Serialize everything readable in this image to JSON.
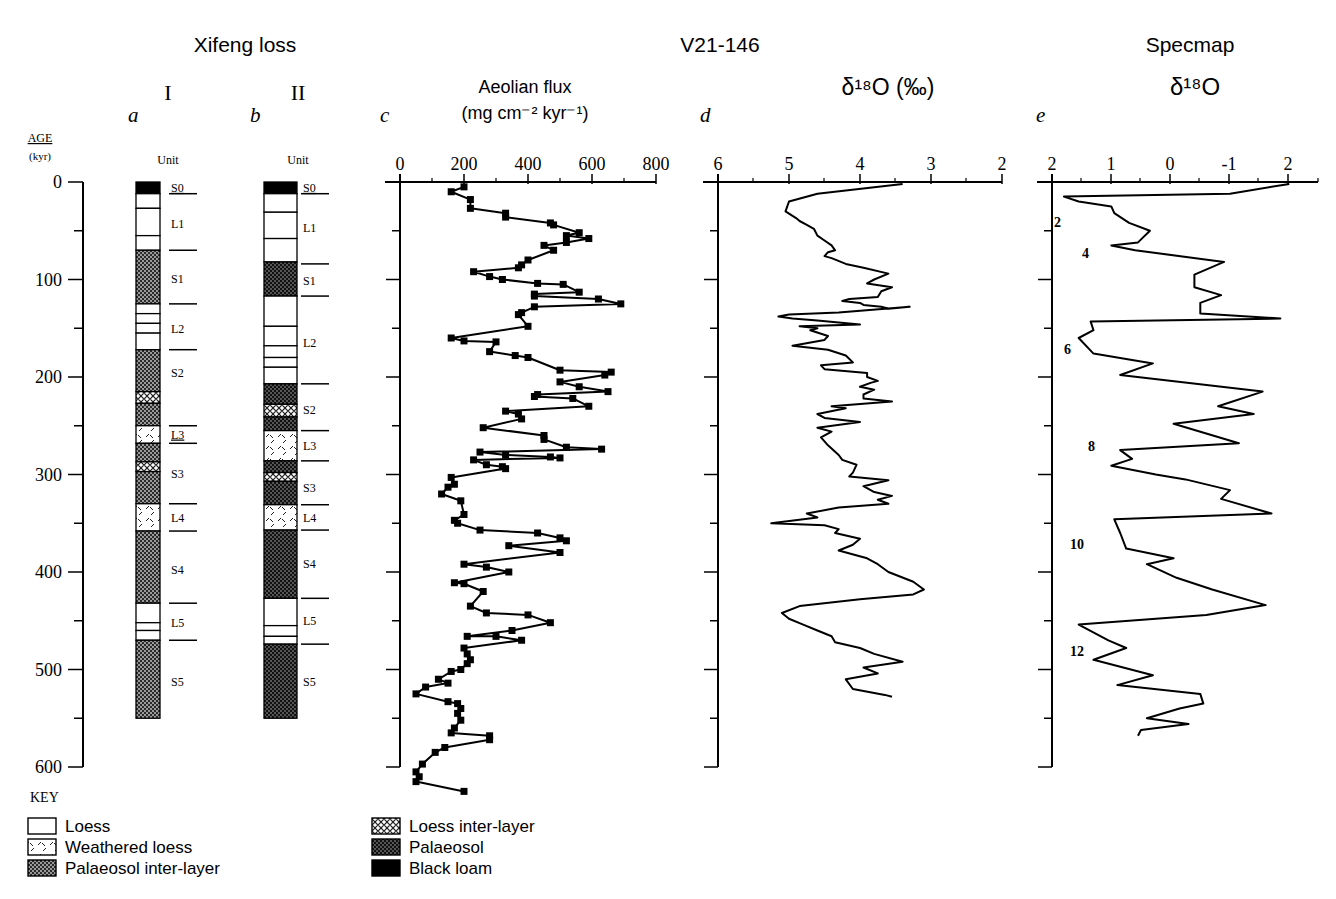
{
  "headers": {
    "xifeng": "Xifeng loss",
    "v21": "V21-146",
    "specmap": "Specmap",
    "col_a_roman": "I",
    "col_b_roman": "II",
    "panels": [
      "a",
      "b",
      "c",
      "d",
      "e"
    ],
    "aeolian_title": "Aeolian flux",
    "aeolian_units": "(mg cm⁻² kyr⁻¹)",
    "d18o_d": "δ¹⁸O (‰)",
    "d18o_e": "δ¹⁸O",
    "unit_label": "Unit"
  },
  "age_axis": {
    "label": "AGE",
    "units": "(kyr)",
    "ticks": [
      0,
      100,
      200,
      300,
      400,
      500,
      600
    ]
  },
  "key": {
    "title": "KEY",
    "items": [
      {
        "label": "Loess",
        "pattern": "loess"
      },
      {
        "label": "Weathered loess",
        "pattern": "weathered"
      },
      {
        "label": "Palaeosol inter-layer",
        "pattern": "palaeo-inter"
      },
      {
        "label": "Loess inter-layer",
        "pattern": "loess-inter"
      },
      {
        "label": "Palaeosol",
        "pattern": "palaeosol"
      },
      {
        "label": "Black loam",
        "pattern": "black"
      }
    ]
  },
  "stratigraphy": {
    "column_a": {
      "layers": [
        {
          "from": 0,
          "to": 12,
          "type": "black"
        },
        {
          "from": 12,
          "to": 27,
          "type": "loess"
        },
        {
          "from": 27,
          "to": 55,
          "type": "loess"
        },
        {
          "from": 55,
          "to": 70,
          "type": "loess"
        },
        {
          "from": 70,
          "to": 125,
          "type": "palaeo-inter"
        },
        {
          "from": 125,
          "to": 135,
          "type": "loess"
        },
        {
          "from": 135,
          "to": 145,
          "type": "loess"
        },
        {
          "from": 145,
          "to": 155,
          "type": "loess"
        },
        {
          "from": 155,
          "to": 172,
          "type": "loess"
        },
        {
          "from": 172,
          "to": 215,
          "type": "palaeo-inter"
        },
        {
          "from": 215,
          "to": 227,
          "type": "loess-inter"
        },
        {
          "from": 227,
          "to": 250,
          "type": "palaeo-inter"
        },
        {
          "from": 250,
          "to": 268,
          "type": "weathered"
        },
        {
          "from": 268,
          "to": 287,
          "type": "palaeo-inter"
        },
        {
          "from": 287,
          "to": 297,
          "type": "loess-inter"
        },
        {
          "from": 297,
          "to": 330,
          "type": "palaeo-inter"
        },
        {
          "from": 330,
          "to": 358,
          "type": "weathered"
        },
        {
          "from": 358,
          "to": 432,
          "type": "palaeo-inter"
        },
        {
          "from": 432,
          "to": 452,
          "type": "loess"
        },
        {
          "from": 452,
          "to": 460,
          "type": "loess"
        },
        {
          "from": 460,
          "to": 470,
          "type": "loess"
        },
        {
          "from": 470,
          "to": 550,
          "type": "palaeo-inter"
        }
      ],
      "units": [
        {
          "label": "S0",
          "at": 5,
          "underline": true
        },
        {
          "label": "L1",
          "at": 42
        },
        {
          "label": "S1",
          "at": 98
        },
        {
          "label": "L2",
          "at": 150
        },
        {
          "label": "S2",
          "at": 195
        },
        {
          "label": "L3",
          "at": 258,
          "underline": true
        },
        {
          "label": "S3",
          "at": 298
        },
        {
          "label": "L4",
          "at": 344
        },
        {
          "label": "S4",
          "at": 397
        },
        {
          "label": "L5",
          "at": 451
        },
        {
          "label": "S5",
          "at": 512
        }
      ],
      "boundaries": [
        12,
        70,
        125,
        172,
        250,
        268,
        330,
        358,
        432,
        470
      ]
    },
    "column_b": {
      "layers": [
        {
          "from": 0,
          "to": 12,
          "type": "black"
        },
        {
          "from": 12,
          "to": 31,
          "type": "loess"
        },
        {
          "from": 31,
          "to": 58,
          "type": "loess"
        },
        {
          "from": 58,
          "to": 82,
          "type": "loess"
        },
        {
          "from": 82,
          "to": 117,
          "type": "palaeosol"
        },
        {
          "from": 117,
          "to": 148,
          "type": "loess"
        },
        {
          "from": 148,
          "to": 168,
          "type": "loess"
        },
        {
          "from": 168,
          "to": 180,
          "type": "loess"
        },
        {
          "from": 180,
          "to": 190,
          "type": "loess"
        },
        {
          "from": 190,
          "to": 207,
          "type": "loess"
        },
        {
          "from": 207,
          "to": 228,
          "type": "palaeosol"
        },
        {
          "from": 228,
          "to": 241,
          "type": "loess-inter"
        },
        {
          "from": 241,
          "to": 255,
          "type": "palaeosol"
        },
        {
          "from": 255,
          "to": 286,
          "type": "weathered"
        },
        {
          "from": 286,
          "to": 298,
          "type": "palaeosol"
        },
        {
          "from": 298,
          "to": 307,
          "type": "loess-inter"
        },
        {
          "from": 307,
          "to": 331,
          "type": "palaeosol"
        },
        {
          "from": 331,
          "to": 357,
          "type": "weathered"
        },
        {
          "from": 357,
          "to": 427,
          "type": "palaeosol"
        },
        {
          "from": 427,
          "to": 455,
          "type": "loess"
        },
        {
          "from": 455,
          "to": 466,
          "type": "loess"
        },
        {
          "from": 466,
          "to": 474,
          "type": "loess"
        },
        {
          "from": 474,
          "to": 550,
          "type": "palaeosol"
        }
      ],
      "units": [
        {
          "label": "S0",
          "at": 5,
          "underline": true
        },
        {
          "label": "L1",
          "at": 46
        },
        {
          "label": "S1",
          "at": 101
        },
        {
          "label": "L2",
          "at": 164
        },
        {
          "label": "S2",
          "at": 233
        },
        {
          "label": "L3",
          "at": 270
        },
        {
          "label": "S3",
          "at": 313
        },
        {
          "label": "L4",
          "at": 344
        },
        {
          "label": "S4",
          "at": 391
        },
        {
          "label": "L5",
          "at": 449
        },
        {
          "label": "S5",
          "at": 512
        }
      ],
      "boundaries": [
        12,
        84,
        117,
        207,
        255,
        286,
        331,
        357,
        427,
        474
      ]
    }
  },
  "chart_data": [
    {
      "type": "line",
      "id": "c",
      "title": "Aeolian flux",
      "xlabel": "Aeolian flux (mg cm^-2 kyr^-1)",
      "ylabel": "Age (kyr)",
      "xlim": [
        0,
        800
      ],
      "ylim": [
        600,
        0
      ],
      "xticks": [
        0,
        200,
        400,
        600,
        800
      ],
      "markers": true,
      "x": [
        200,
        160,
        220,
        220,
        330,
        330,
        470,
        480,
        560,
        520,
        590,
        520,
        450,
        480,
        400,
        380,
        370,
        230,
        280,
        320,
        430,
        510,
        560,
        420,
        420,
        620,
        690,
        420,
        380,
        370,
        400,
        160,
        200,
        300,
        280,
        360,
        400,
        500,
        660,
        640,
        500,
        560,
        650,
        430,
        420,
        540,
        590,
        330,
        370,
        380,
        260,
        450,
        450,
        520,
        630,
        250,
        330,
        470,
        500,
        230,
        270,
        320,
        330,
        160,
        170,
        150,
        130,
        190,
        200,
        170,
        180,
        250,
        430,
        500,
        520,
        340,
        500,
        200,
        270,
        340,
        170,
        200,
        260,
        220,
        270,
        400,
        470,
        350,
        210,
        300,
        380,
        200,
        210,
        220,
        210,
        190,
        160,
        120,
        150,
        80,
        50,
        150,
        180,
        190,
        180,
        190,
        170,
        160,
        280,
        280,
        140,
        110,
        70,
        50,
        60,
        50,
        200
      ],
      "y": [
        5,
        10,
        18,
        27,
        32,
        36,
        42,
        44,
        52,
        55,
        58,
        62,
        65,
        70,
        80,
        85,
        88,
        92,
        97,
        100,
        104,
        105,
        113,
        115,
        117,
        120,
        125,
        128,
        134,
        136,
        148,
        160,
        163,
        164,
        174,
        178,
        180,
        193,
        195,
        198,
        205,
        210,
        215,
        218,
        220,
        222,
        230,
        235,
        238,
        243,
        252,
        260,
        264,
        272,
        274,
        277,
        280,
        282,
        283,
        285,
        290,
        292,
        294,
        303,
        310,
        313,
        320,
        327,
        341,
        347,
        350,
        357,
        360,
        365,
        368,
        373,
        380,
        392,
        395,
        400,
        411,
        412,
        420,
        435,
        442,
        444,
        452,
        460,
        466,
        466,
        470,
        478,
        484,
        490,
        494,
        500,
        502,
        510,
        514,
        518,
        525,
        533,
        535,
        540,
        545,
        552,
        560,
        565,
        568,
        572,
        580,
        585,
        597,
        605,
        610,
        615,
        625
      ]
    },
    {
      "type": "line",
      "id": "d",
      "title": "V21-146 d18O",
      "xlabel": "d18O (per mil)",
      "ylabel": "Age (kyr)",
      "xlim": [
        6,
        2
      ],
      "ylim": [
        600,
        0
      ],
      "xticks": [
        6,
        5,
        4,
        3,
        2
      ],
      "x": [
        3.4,
        4.6,
        5.0,
        5.05,
        4.9,
        4.85,
        4.75,
        4.65,
        4.6,
        4.5,
        4.4,
        4.35,
        4.45,
        4.5,
        4.4,
        4.2,
        3.95,
        3.6,
        3.8,
        3.9,
        3.55,
        3.7,
        3.75,
        4.15,
        4.25,
        4.0,
        3.95,
        3.7,
        3.6,
        3.3,
        4.3,
        5.0,
        5.15,
        4.95,
        4.6,
        4.0,
        4.85,
        4.6,
        4.7,
        4.45,
        4.5,
        4.95,
        4.45,
        4.2,
        4.1,
        4.55,
        4.5,
        3.9,
        3.9,
        3.75,
        3.85,
        4.0,
        3.8,
        3.95,
        3.95,
        3.55,
        4.4,
        4.2,
        4.6,
        4.5,
        4.0,
        4.6,
        4.4,
        4.55,
        4.45,
        4.3,
        4.25,
        4.05,
        4.1,
        4.15,
        3.6,
        3.95,
        3.8,
        3.55,
        3.75,
        3.6,
        4.3,
        4.75,
        4.6,
        5.25,
        4.5,
        4.3,
        4.35,
        4.0,
        4.1,
        4.3,
        3.9,
        3.75,
        3.6,
        3.25,
        3.1,
        3.25,
        4.0,
        4.85,
        5.1,
        5.0,
        4.8,
        4.6,
        4.4,
        4.35,
        4.0,
        3.8,
        3.4,
        3.95,
        3.75,
        4.2,
        4.1,
        3.65,
        3.55
      ],
      "y": [
        2,
        12,
        20,
        30,
        37,
        40,
        44,
        48,
        55,
        60,
        65,
        70,
        72,
        76,
        78,
        84,
        88,
        94,
        100,
        104,
        108,
        112,
        118,
        120,
        122,
        124,
        126,
        128,
        130,
        128,
        134,
        136,
        138,
        140,
        142,
        146,
        148,
        150,
        152,
        158,
        162,
        168,
        172,
        178,
        185,
        188,
        192,
        196,
        200,
        204,
        206,
        210,
        213,
        218,
        222,
        225,
        230,
        232,
        238,
        242,
        246,
        252,
        256,
        262,
        270,
        280,
        285,
        290,
        298,
        302,
        306,
        312,
        318,
        322,
        326,
        330,
        334,
        340,
        344,
        350,
        352,
        356,
        360,
        366,
        372,
        378,
        386,
        392,
        400,
        410,
        418,
        423,
        428,
        435,
        442,
        448,
        454,
        460,
        466,
        472,
        478,
        484,
        492,
        498,
        504,
        510,
        520,
        526,
        528
      ]
    },
    {
      "type": "line",
      "id": "e",
      "title": "Specmap d18O",
      "xlabel": "d18O",
      "ylabel": "Age (kyr)",
      "xtick_labels": [
        "2",
        "1",
        "0",
        "-1",
        "2"
      ],
      "xlim": [
        2,
        -2.5
      ],
      "ylim": [
        600,
        0
      ],
      "stage_labels": [
        {
          "label": "2",
          "age": 40
        },
        {
          "label": "4",
          "age": 72
        },
        {
          "label": "6",
          "age": 170
        },
        {
          "label": "8",
          "age": 270
        },
        {
          "label": "10",
          "age": 370
        },
        {
          "label": "12",
          "age": 480
        }
      ],
      "x": [
        -2.0,
        -1.0,
        1.8,
        1.55,
        1.0,
        0.95,
        0.7,
        0.35,
        0.55,
        1.0,
        0.6,
        -0.9,
        -0.4,
        -0.4,
        -0.85,
        -0.5,
        -0.5,
        -1.85,
        1.35,
        1.3,
        1.55,
        1.3,
        0.3,
        0.85,
        -1.55,
        -0.8,
        -1.4,
        -0.05,
        -1.15,
        0.85,
        0.65,
        1.0,
        0.25,
        -0.25,
        -1.0,
        -0.85,
        -1.7,
        0.95,
        0.85,
        0.75,
        -0.05,
        0.4,
        -0.1,
        -0.7,
        -1.6,
        -0.6,
        1.55,
        1.05,
        0.75,
        1.3,
        0.3,
        0.9,
        -0.5,
        -0.55,
        -0.15,
        0.4,
        -0.3,
        0.5,
        0.55
      ],
      "y": [
        2,
        12,
        15,
        20,
        25,
        32,
        42,
        50,
        62,
        65,
        70,
        82,
        95,
        108,
        116,
        124,
        135,
        140,
        143,
        152,
        160,
        176,
        186,
        198,
        215,
        230,
        238,
        248,
        268,
        275,
        284,
        291,
        300,
        305,
        316,
        325,
        340,
        346,
        360,
        376,
        386,
        392,
        406,
        418,
        434,
        444,
        454,
        470,
        478,
        490,
        506,
        516,
        525,
        535,
        540,
        550,
        556,
        562,
        568
      ]
    }
  ]
}
